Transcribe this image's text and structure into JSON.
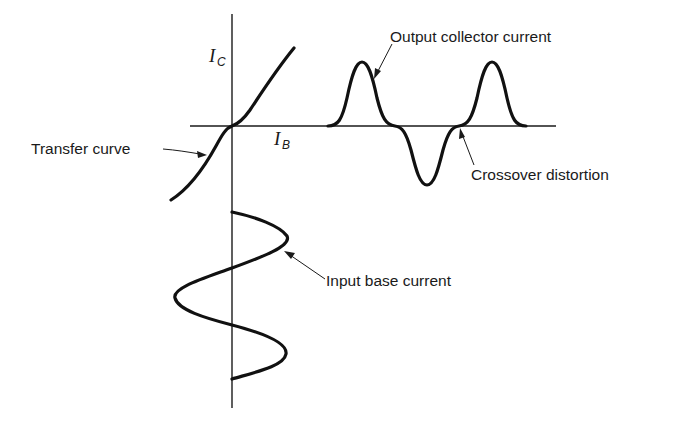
{
  "diagram": {
    "axes": {
      "vertical_symbol": "I",
      "vertical_subscript": "C",
      "horizontal_symbol": "I",
      "horizontal_subscript": "B"
    },
    "labels": {
      "transfer_curve": "Transfer curve",
      "output_collector_current": "Output collector current",
      "crossover_distortion": "Crossover distortion",
      "input_base_current": "Input base current"
    },
    "colors": {
      "ink": "#111111",
      "background": "#ffffff"
    }
  }
}
